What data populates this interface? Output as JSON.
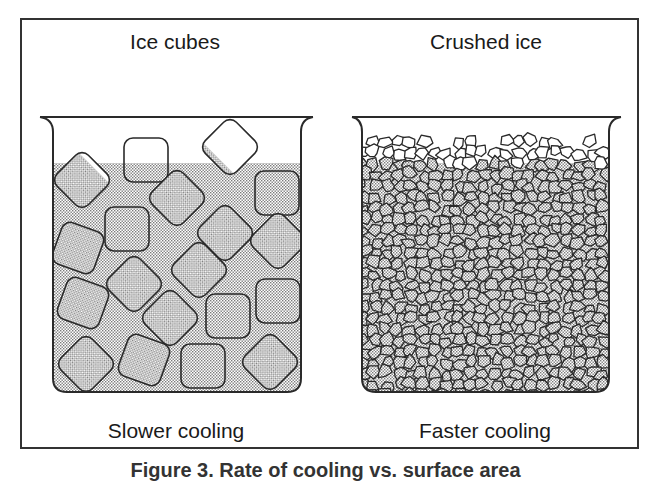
{
  "figure": {
    "left_panel": {
      "title": "Ice cubes",
      "subtitle": "Slower cooling"
    },
    "right_panel": {
      "title": "Crushed ice",
      "subtitle": "Faster cooling"
    },
    "caption": "Figure 3.  Rate of cooling vs. surface area"
  },
  "colors": {
    "line": "#2a2a2a",
    "water_dot": "#8a8a8a",
    "background": "#ffffff"
  },
  "ice_cubes": [
    {
      "cx": 146,
      "cy": 160,
      "s": 44,
      "rot": 0
    },
    {
      "cx": 230,
      "cy": 147,
      "s": 44,
      "rot": 45
    },
    {
      "cx": 82,
      "cy": 180,
      "s": 44,
      "rot": 45
    },
    {
      "cx": 277,
      "cy": 193,
      "s": 44,
      "rot": 0
    },
    {
      "cx": 177,
      "cy": 198,
      "s": 44,
      "rot": 45
    },
    {
      "cx": 127,
      "cy": 229,
      "s": 44,
      "rot": 0
    },
    {
      "cx": 225,
      "cy": 233,
      "s": 44,
      "rot": 45
    },
    {
      "cx": 278,
      "cy": 241,
      "s": 44,
      "rot": 45
    },
    {
      "cx": 78,
      "cy": 248,
      "s": 44,
      "rot": 20
    },
    {
      "cx": 134,
      "cy": 284,
      "s": 44,
      "rot": 45
    },
    {
      "cx": 199,
      "cy": 270,
      "s": 44,
      "rot": 45
    },
    {
      "cx": 278,
      "cy": 301,
      "s": 44,
      "rot": 0
    },
    {
      "cx": 83,
      "cy": 303,
      "s": 44,
      "rot": 20
    },
    {
      "cx": 170,
      "cy": 318,
      "s": 44,
      "rot": 45
    },
    {
      "cx": 228,
      "cy": 316,
      "s": 44,
      "rot": 0
    },
    {
      "cx": 86,
      "cy": 364,
      "s": 44,
      "rot": 45
    },
    {
      "cx": 144,
      "cy": 360,
      "s": 44,
      "rot": 20
    },
    {
      "cx": 203,
      "cy": 366,
      "s": 44,
      "rot": 0
    },
    {
      "cx": 270,
      "cy": 362,
      "s": 44,
      "rot": 45
    }
  ]
}
